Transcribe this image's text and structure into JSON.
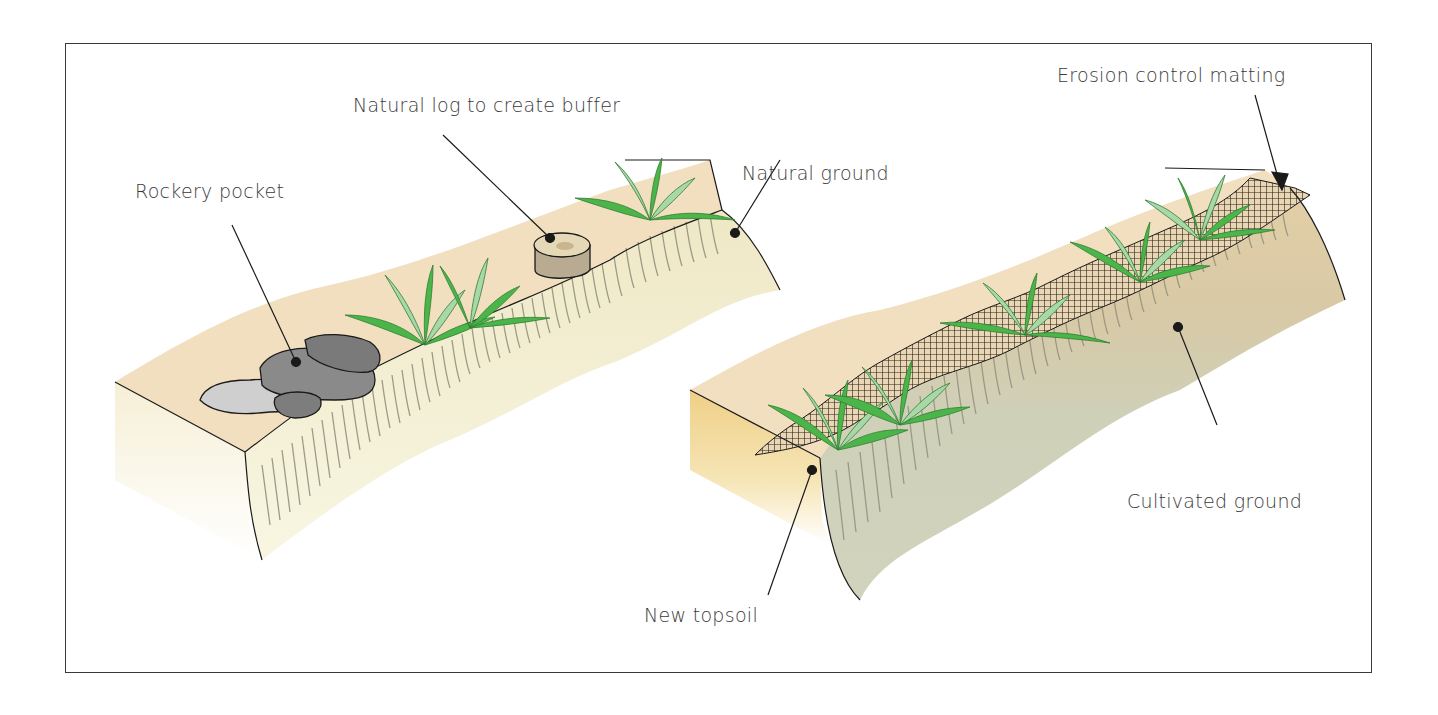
{
  "diagram": {
    "panels": [
      {
        "name": "natural-slope",
        "labels": {
          "rockery_pocket": "Rockery pocket",
          "natural_log": "Natural log to create buffer",
          "natural_ground": "Natural ground"
        }
      },
      {
        "name": "cultivated-slope",
        "labels": {
          "erosion_matting": "Erosion control matting",
          "cultivated_ground": "Cultivated ground",
          "new_topsoil": "New topsoil"
        }
      }
    ],
    "colors": {
      "surface": "#f2dfc0",
      "face_natural": "#f4f1d6",
      "face_cultivated": "#cfd0b8",
      "topsoil_band": "#e0caa0",
      "topsoil_side": "#efd08a",
      "plant_dark": "#4cb54a",
      "plant_light": "#a8d8a8",
      "rock_dark": "#7d7d7d",
      "rock_light": "#c8c8c8",
      "log": "#b8ab92",
      "line": "#1a1a1a",
      "text": "#3a3a3a"
    }
  }
}
